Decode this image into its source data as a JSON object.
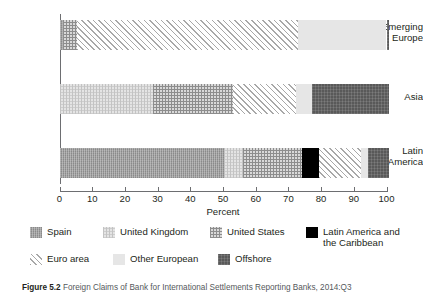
{
  "chart_data": {
    "type": "bar",
    "orientation": "horizontal",
    "stacked": true,
    "title": "",
    "xlabel": "Percent",
    "ylabel": "",
    "xlim": [
      0,
      101
    ],
    "xticks": [
      0,
      10,
      20,
      30,
      40,
      50,
      60,
      70,
      80,
      90,
      100
    ],
    "xtick_labels": [
      "0",
      "10",
      "20",
      "30",
      "40",
      "50",
      "60",
      "70",
      "80",
      "90",
      "100"
    ],
    "grid": false,
    "legend_position": "below",
    "categories": [
      "Emerging Europe",
      "Asia",
      "Latin America"
    ],
    "series": [
      {
        "name": "Spain",
        "key": "spain",
        "color": "#9a9a9a",
        "pattern": "solid-gray",
        "values": [
          1.0,
          0.0,
          50.4
        ]
      },
      {
        "name": "United Kingdom",
        "key": "uk",
        "color": "#e4e4e4",
        "pattern": "fine-dots",
        "values": [
          0.0,
          28.5,
          5.8
        ]
      },
      {
        "name": "United States",
        "key": "us",
        "color": "#d9d9d9",
        "pattern": "checker",
        "values": [
          4.4,
          24.7,
          17.9
        ]
      },
      {
        "name": "Latin America and the Caribbean",
        "key": "latam",
        "color": "#000000",
        "pattern": "solid-black",
        "values": [
          0.0,
          0.0,
          5.4
        ]
      },
      {
        "name": "Euro area",
        "key": "euro",
        "color": "#ffffff",
        "pattern": "diagonal",
        "values": [
          67.5,
          19.0,
          12.7
        ]
      },
      {
        "name": "Other European",
        "key": "other",
        "color": "#e6e6e6",
        "pattern": "solid-light",
        "values": [
          27.1,
          4.9,
          2.2
        ]
      },
      {
        "name": "Offshore",
        "key": "offshore",
        "color": "#595959",
        "pattern": "solid-dark",
        "values": [
          0.9,
          23.8,
          6.5
        ]
      }
    ],
    "bars": [
      {
        "category": "Emerging Europe",
        "category_line1": "Emerging",
        "category_line2": "Europe",
        "segments": [
          {
            "key": "spain",
            "label": "Spain",
            "start": 0.0,
            "end": 1.0,
            "value": 1.0
          },
          {
            "key": "us",
            "label": "United States",
            "start": 1.0,
            "end": 5.4,
            "value": 4.4
          },
          {
            "key": "euro",
            "label": "Euro area",
            "start": 5.4,
            "end": 72.9,
            "value": 67.5
          },
          {
            "key": "other",
            "label": "Other European",
            "start": 72.9,
            "end": 100.0,
            "value": 27.1
          },
          {
            "key": "offshore",
            "label": "Offshore",
            "start": 100.0,
            "end": 100.9,
            "value": 0.9
          }
        ]
      },
      {
        "category": "Asia",
        "category_line1": "Asia",
        "category_line2": "",
        "segments": [
          {
            "key": "uk",
            "label": "United Kingdom",
            "start": 0.0,
            "end": 28.5,
            "value": 28.5
          },
          {
            "key": "us",
            "label": "United States",
            "start": 28.5,
            "end": 53.2,
            "value": 24.7
          },
          {
            "key": "euro",
            "label": "Euro area",
            "start": 53.2,
            "end": 72.2,
            "value": 19.0
          },
          {
            "key": "other",
            "label": "Other European",
            "start": 72.2,
            "end": 77.1,
            "value": 4.9
          },
          {
            "key": "offshore",
            "label": "Offshore",
            "start": 77.1,
            "end": 100.9,
            "value": 23.8
          }
        ]
      },
      {
        "category": "Latin America",
        "category_line1": "Latin",
        "category_line2": "America",
        "segments": [
          {
            "key": "spain",
            "label": "Spain",
            "start": 0.0,
            "end": 50.4,
            "value": 50.4
          },
          {
            "key": "uk",
            "label": "United Kingdom",
            "start": 50.4,
            "end": 56.2,
            "value": 5.8
          },
          {
            "key": "us",
            "label": "United States",
            "start": 56.2,
            "end": 74.1,
            "value": 17.9
          },
          {
            "key": "latam",
            "label": "Latin America and the Caribbean",
            "start": 74.1,
            "end": 79.5,
            "value": 5.4
          },
          {
            "key": "euro",
            "label": "Euro area",
            "start": 79.5,
            "end": 92.2,
            "value": 12.7
          },
          {
            "key": "other",
            "label": "Other European",
            "start": 92.2,
            "end": 94.4,
            "value": 2.2
          },
          {
            "key": "offshore",
            "label": "Offshore",
            "start": 94.4,
            "end": 100.9,
            "value": 6.5
          }
        ]
      }
    ]
  },
  "axis": {
    "x_title": "Percent",
    "tick_labels": [
      "0",
      "10",
      "20",
      "30",
      "40",
      "50",
      "60",
      "70",
      "80",
      "90",
      "100"
    ]
  },
  "legend": {
    "row1": [
      {
        "key": "spain",
        "label": "Spain"
      },
      {
        "key": "uk",
        "label": "United Kingdom"
      },
      {
        "key": "us",
        "label": "United States"
      },
      {
        "key": "latam",
        "label": "Latin America and the Caribbean"
      }
    ],
    "row2": [
      {
        "key": "euro",
        "label": "Euro area"
      },
      {
        "key": "other",
        "label": "Other European"
      },
      {
        "key": "offshore",
        "label": "Offshore"
      }
    ]
  },
  "caption": {
    "number": "Figure 5.2",
    "text": "Foreign Claims of Bank for International Settlements Reporting Banks, 2014:Q3"
  }
}
